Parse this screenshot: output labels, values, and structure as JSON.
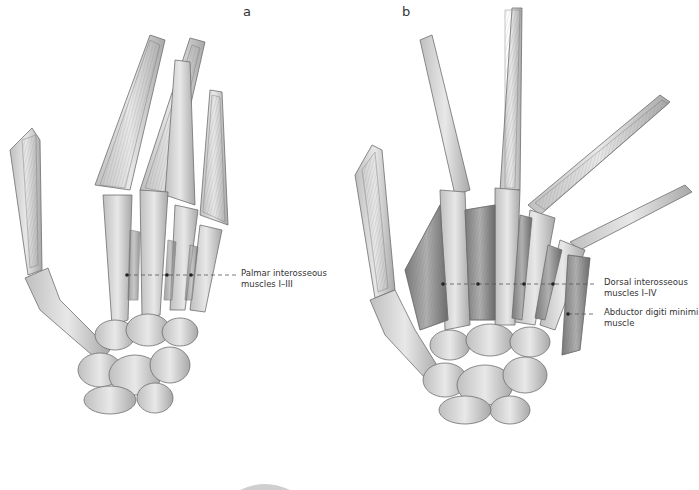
{
  "figures": [
    {
      "letter": "a",
      "view": "palmar",
      "labels": [
        {
          "line1": "Palmar interosseous",
          "line2": "muscles I–III"
        }
      ]
    },
    {
      "letter": "b",
      "view": "dorsal",
      "labels": [
        {
          "line1": "Dorsal interosseous",
          "line2": "muscles I–IV"
        },
        {
          "line1": "Abductor digiti minimi",
          "line2": "muscle"
        }
      ]
    }
  ],
  "colors": {
    "bone_fill": "#d9d9d9",
    "bone_stroke": "#6f6f6f",
    "muscle_fill": "#9a9a9a",
    "tendon_fill": "#c4c4c4",
    "leader_line": "#555555"
  }
}
